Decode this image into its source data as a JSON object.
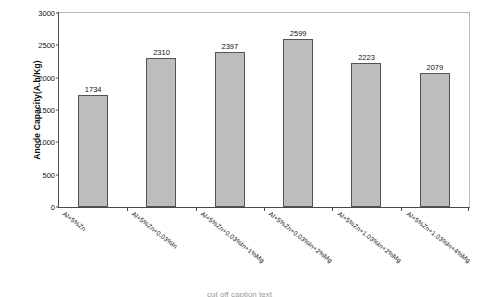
{
  "chart_data": {
    "type": "bar",
    "title": "",
    "xlabel": "",
    "ylabel": "Anode Capacity(A.h/Kg)",
    "ylim": [
      0,
      3000
    ],
    "ytick_labels": [
      "3000",
      "2500",
      "2000",
      "1500",
      "1000",
      "500",
      "0"
    ],
    "ytick_values": [
      3000,
      2500,
      2000,
      1500,
      1000,
      500,
      0
    ],
    "grid": false,
    "legend": false,
    "categories": [
      "Al+5%Zn",
      "Al+5%Zn+0.03%In",
      "Al+5%Zn+0.03%In+1%Mg",
      "Al+5%Zn+0.03%In+2%Mg",
      "Al+5%Zn+1.03%In+2%Mg",
      "Al+5%Zn+1.03%In+4%Mg"
    ],
    "values": [
      1734,
      2310,
      2397,
      2599,
      2223,
      2079
    ],
    "value_labels": [
      "1734",
      "2310",
      "2397",
      "2599",
      "2223",
      "2079"
    ],
    "bar_color": "#bdbdbd",
    "bar_edge_color": "#535353",
    "axis_color": "#4a4a4a",
    "frame_color": "#b9b9b9"
  },
  "caption": {
    "text": "cut off caption text"
  }
}
